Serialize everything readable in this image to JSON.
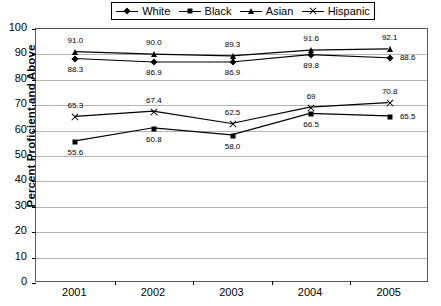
{
  "chart_data": {
    "type": "line",
    "title": "",
    "xlabel": "",
    "ylabel": "Percent Proficient and Above",
    "categories": [
      "2001",
      "2002",
      "2003",
      "2004",
      "2005"
    ],
    "ylim": [
      0,
      100
    ],
    "ytick_values": [
      0,
      10,
      20,
      30,
      40,
      50,
      60,
      70,
      80,
      90,
      100
    ],
    "ytick_labels": [
      "0",
      "10",
      "20",
      "30",
      "40",
      "50",
      "60",
      "70",
      "80",
      "90",
      "100"
    ],
    "grid": true,
    "legend_position": "top-center",
    "series": [
      {
        "name": "White",
        "marker": "diamond",
        "values": [
          88.3,
          86.9,
          86.9,
          89.8,
          88.6
        ],
        "labels": [
          "88.3",
          "86.9",
          "86.9",
          "89.8",
          "88.6"
        ],
        "label_positions": [
          "below",
          "below",
          "below",
          "below",
          "right"
        ]
      },
      {
        "name": "Black",
        "marker": "square",
        "values": [
          55.6,
          60.8,
          58.0,
          66.5,
          65.5
        ],
        "labels": [
          "55.6",
          "60.8",
          "58.0",
          "66.5",
          "65.5"
        ],
        "label_positions": [
          "below",
          "below",
          "below",
          "below",
          "right"
        ]
      },
      {
        "name": "Asian",
        "marker": "triangle",
        "values": [
          91.0,
          90.0,
          89.3,
          91.6,
          92.1
        ],
        "labels": [
          "91.0",
          "90.0",
          "89.3",
          "91.6",
          "92.1"
        ],
        "label_positions": [
          "above",
          "above",
          "above",
          "above",
          "above"
        ]
      },
      {
        "name": "Hispanic",
        "marker": "x",
        "values": [
          65.3,
          67.4,
          62.5,
          69.0,
          70.8
        ],
        "labels": [
          "65.3",
          "67.4",
          "62.5",
          "69",
          "70.8"
        ],
        "label_positions": [
          "above",
          "above",
          "above",
          "above",
          "above"
        ]
      }
    ],
    "colors": {
      "series": "#000000",
      "gridline": "#b4b4b4",
      "plot_border": "#5a5a5a",
      "background": "#ffffff"
    }
  },
  "legend": {
    "entries": [
      {
        "label": "White",
        "marker": "diamond"
      },
      {
        "label": "Black",
        "marker": "square"
      },
      {
        "label": "Asian",
        "marker": "triangle"
      },
      {
        "label": "Hispanic",
        "marker": "x"
      }
    ]
  }
}
